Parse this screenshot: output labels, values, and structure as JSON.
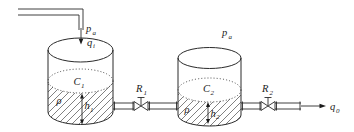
{
  "diagram": {
    "colors": {
      "stroke": "#2a2a2a",
      "text": "#1c1c1c",
      "hatch": "#4a4a4a",
      "background": "#ffffff"
    },
    "labels": {
      "pa1": {
        "base": "p",
        "sub": "a"
      },
      "qi": {
        "base": "q",
        "sub": "i"
      },
      "C1": {
        "base": "C",
        "sub": "1"
      },
      "rho1": {
        "base": "ρ",
        "sub": ""
      },
      "h1": {
        "base": "h",
        "sub": "1"
      },
      "R1": {
        "base": "R",
        "sub": "1"
      },
      "pa2": {
        "base": "p",
        "sub": "a"
      },
      "C2": {
        "base": "C",
        "sub": "2"
      },
      "rho2": {
        "base": "ρ",
        "sub": ""
      },
      "h2": {
        "base": "h",
        "sub": "2"
      },
      "R2": {
        "base": "R",
        "sub": "2"
      },
      "q0": {
        "base": "q",
        "sub": "0"
      }
    }
  }
}
